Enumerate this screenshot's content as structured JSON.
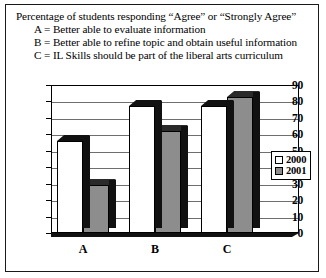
{
  "caption": {
    "title": "Percentage of students responding “Agree” or “Strongly Agree”",
    "lines": [
      "A = Better able to evaluate information",
      "B = Better able to refine topic and obtain useful information",
      "C = IL Skills should be part of the liberal arts curriculum"
    ]
  },
  "legend": {
    "items": [
      {
        "label": "2000",
        "color": "#ffffff"
      },
      {
        "label": "2001",
        "color": "#8d8d8d"
      }
    ]
  },
  "chart_data": {
    "type": "bar",
    "title": "Percentage of students responding “Agree” or “Strongly Agree”",
    "xlabel": "",
    "ylabel": "",
    "ylim": [
      0,
      90
    ],
    "yticks": [
      0,
      10,
      20,
      30,
      40,
      50,
      60,
      70,
      80,
      90
    ],
    "ytick_labels": [
      "0",
      "10",
      "20",
      "30",
      "40",
      "50",
      "60",
      "70",
      "80",
      "90"
    ],
    "grid": true,
    "legend_position": "right",
    "categories": [
      "A",
      "B",
      "C"
    ],
    "series": [
      {
        "name": "2000",
        "color": "#ffffff",
        "values": [
          56,
          77,
          77
        ]
      },
      {
        "name": "2001",
        "color": "#8d8d8d",
        "values": [
          29,
          62,
          83
        ]
      }
    ]
  }
}
